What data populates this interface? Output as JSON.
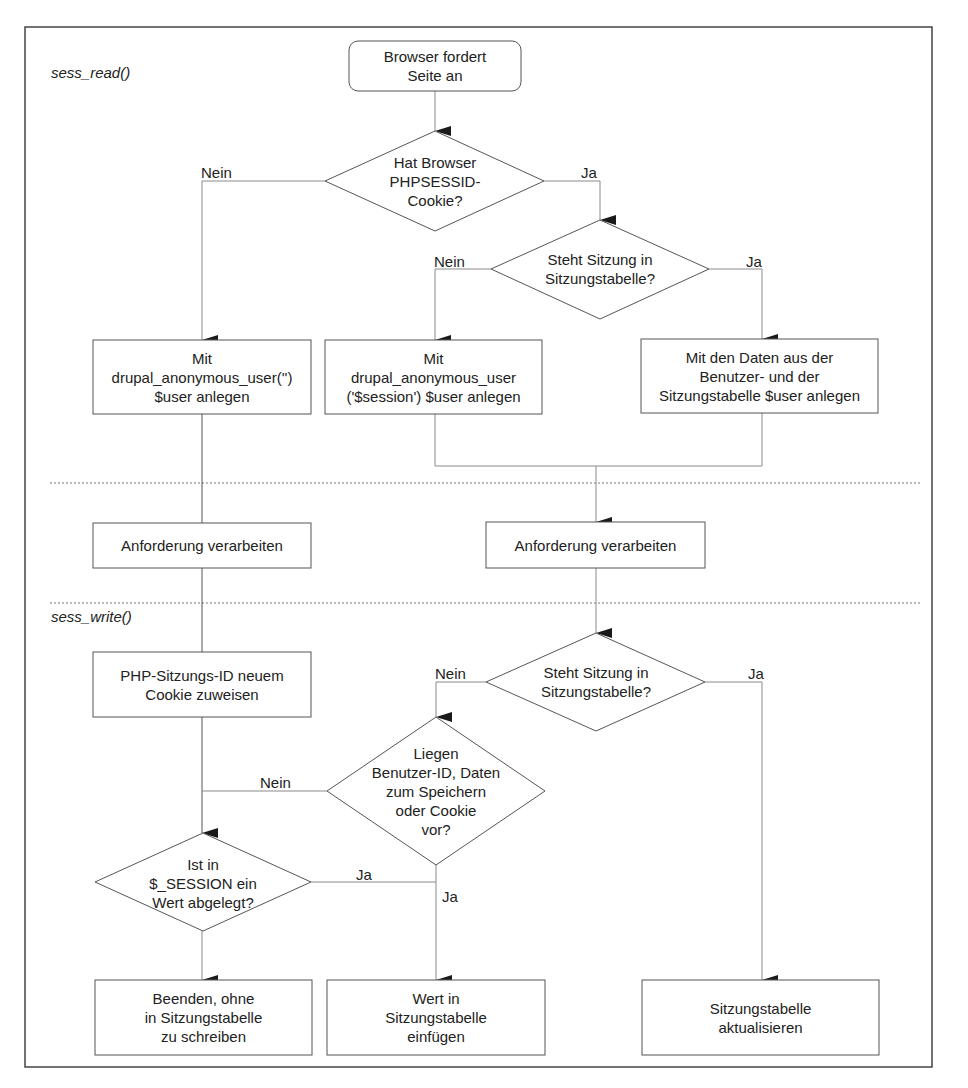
{
  "sections": {
    "read_label": "sess_read()",
    "write_label": "sess_write()"
  },
  "nodes": {
    "start": "Browser fordert\nSeite an",
    "q_cookie": "Hat Browser\nPHPSESSID-\nCookie?",
    "q_session_read": "Steht Sitzung in\nSitzungstabelle?",
    "box_anon_empty": "Mit\ndrupal_anonymous_user('')\n$user anlegen",
    "box_anon_session": "Mit\ndrupal_anonymous_user\n('$session') $user anlegen",
    "box_user_data": "Mit den Daten aus der\nBenutzer- und der\nSitzungstabelle $user anlegen",
    "process_left": "Anforderung verarbeiten",
    "process_right": "Anforderung verarbeiten",
    "box_new_cookie": "PHP-Sitzungs-ID neuem\nCookie zuweisen",
    "q_session_write": "Steht Sitzung in\nSitzungstabelle?",
    "q_data_present": "Liegen\nBenutzer-ID, Daten\nzum Speichern\noder Cookie\nvor?",
    "q_session_value": "Ist in\n$_SESSION ein\nWert abgelegt?",
    "end_no_write": "Beenden, ohne\nin Sitzungstabelle\nzu schreiben",
    "end_insert": "Wert in\nSitzungstabelle\neinfügen",
    "end_update": "Sitzungstabelle\naktualisieren"
  },
  "edges": {
    "cookie_no": "Nein",
    "cookie_yes": "Ja",
    "read_no": "Nein",
    "read_yes": "Ja",
    "write_no": "Nein",
    "write_yes": "Ja",
    "data_no": "Nein",
    "data_yes": "Ja",
    "value_yes": "Ja"
  },
  "colors": {
    "line": "#8a8a8a",
    "border": "#555555",
    "arrow": "#1a1a1a",
    "frame": "#444444"
  }
}
